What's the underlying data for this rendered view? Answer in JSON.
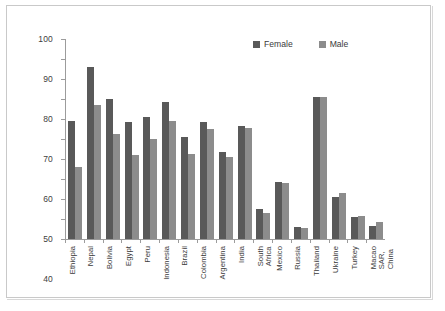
{
  "chart_data": {
    "type": "bar",
    "title": "",
    "xlabel": "",
    "ylabel": "",
    "ylim": [
      0,
      100
    ],
    "yticks": [
      0,
      10,
      20,
      30,
      40,
      50,
      60,
      70,
      80,
      90,
      100
    ],
    "grid": false,
    "legend_position": "top-right",
    "colors": {
      "female": "#595959",
      "male": "#8c8c8c"
    },
    "categories": [
      "Ethiopia",
      "Nepal",
      "Bolivia",
      "Egypt",
      "Peru",
      "Indonesia",
      "Brazil",
      "Colombia",
      "Argentina",
      "India",
      "South Africa",
      "Mexico",
      "Russia",
      "Thailand",
      "Ukraine",
      "Turkey",
      "Macao SAR,\nChina"
    ],
    "series": [
      {
        "name": "Female",
        "values": [
          59,
          86,
          70,
          58.5,
          61,
          68.5,
          51,
          58.5,
          43.5,
          56.5,
          14.8,
          28.3,
          6,
          71,
          21,
          10.8,
          6.3
        ]
      },
      {
        "name": "Male",
        "values": [
          36,
          67,
          52.5,
          42,
          50,
          59,
          42.5,
          55,
          40.8,
          55.3,
          13.2,
          28,
          5.7,
          71,
          23,
          11.5,
          8.5
        ]
      }
    ]
  }
}
